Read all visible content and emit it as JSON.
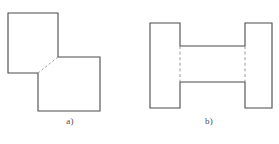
{
  "sheet": {
    "background_color": "#ffffff",
    "line_color": "#4a4a4a",
    "hidden_line_color": "#9a9a9a",
    "fill_color": "#ffffff"
  },
  "figures": [
    {
      "id": "figure-a",
      "caption": "a)",
      "shape_name": "two-offset-squares-joined-at-corner",
      "description": "Two equal squares touching at a single corner, upper-left square and lower-right square, with a hidden dashed diagonal across the shared corner",
      "outline_points": "8,13 58,13 58,57 100,57 100,111 38,111 38,73 8,73",
      "hidden_line": {
        "x1": 38,
        "y1": 73,
        "x2": 58,
        "y2": 57
      },
      "upper_square": {
        "x": 8,
        "y": 13,
        "width": 50,
        "height": 60
      },
      "lower_square": {
        "x": 38,
        "y": 57,
        "width": 62,
        "height": 54
      }
    },
    {
      "id": "figure-b",
      "caption": "b)",
      "shape_name": "h-beam-profile",
      "description": "H-shaped (I-beam) profile formed by two vertical flanges joined by a horizontal web, with hidden dashed lines at the two web-to-flange junctions",
      "outline_points": "11,23 41,23 41,46 106,46 106,23 133,23 133,108 106,108 106,82 41,82 41,108 11,108",
      "hidden_lines": [
        {
          "x1": 41,
          "y1": 46,
          "x2": 41,
          "y2": 82
        },
        {
          "x1": 106,
          "y1": 46,
          "x2": 106,
          "y2": 82
        }
      ],
      "left_flange": {
        "x": 11,
        "y": 23,
        "width": 30,
        "height": 85
      },
      "right_flange": {
        "x": 106,
        "y": 23,
        "width": 27,
        "height": 85
      },
      "web": {
        "x": 41,
        "y": 46,
        "width": 65,
        "height": 36
      }
    }
  ]
}
